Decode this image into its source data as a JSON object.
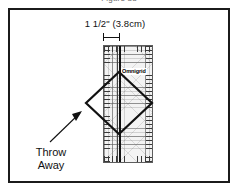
{
  "figure": {
    "caption": "Figure 33"
  },
  "measurement": {
    "label": "1 1/2\" (3.8cm)",
    "inches": "1 1/2\"",
    "centimeters": "3.8cm"
  },
  "ruler": {
    "brand": "Omnigrid",
    "type": "quilting-ruler",
    "grid": "on"
  },
  "annotation": {
    "line1": "Throw",
    "line2": "Away"
  },
  "colors": {
    "frame": "#1b1b1b",
    "ruler_fill": "#f3f3f3",
    "ruler_border": "#5d5d5d",
    "line": "#111111",
    "grid": "#5a5a5a",
    "background": "#ffffff"
  }
}
